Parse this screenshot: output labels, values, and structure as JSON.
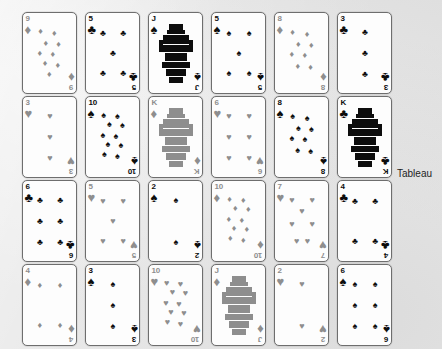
{
  "label": {
    "tableau": "Tableau"
  },
  "colors": {
    "background": "#e8e8e8",
    "card_face": "#fdfdfd",
    "card_border": "#6e6e6e",
    "black_suit": "#0d0d0d",
    "red_suit": "#8e8e8e",
    "label_text": "#1d1d1d"
  },
  "glyphs": {
    "spade": "♠",
    "heart": "♥",
    "diamond": "♦",
    "club": "♣"
  },
  "tableau": {
    "columns": 6,
    "rows": 4,
    "count": 24,
    "cards": [
      {
        "rank": "9",
        "suit": "diamond",
        "color": "red",
        "row": 1,
        "col": 1
      },
      {
        "rank": "5",
        "suit": "club",
        "color": "black",
        "row": 1,
        "col": 2
      },
      {
        "rank": "J",
        "suit": "spade",
        "color": "black",
        "row": 1,
        "col": 3
      },
      {
        "rank": "5",
        "suit": "spade",
        "color": "black",
        "row": 1,
        "col": 4
      },
      {
        "rank": "8",
        "suit": "diamond",
        "color": "red",
        "row": 1,
        "col": 5
      },
      {
        "rank": "3",
        "suit": "club",
        "color": "black",
        "row": 1,
        "col": 6
      },
      {
        "rank": "3",
        "suit": "heart",
        "color": "red",
        "row": 2,
        "col": 1
      },
      {
        "rank": "10",
        "suit": "spade",
        "color": "black",
        "row": 2,
        "col": 2
      },
      {
        "rank": "K",
        "suit": "diamond",
        "color": "red",
        "row": 2,
        "col": 3
      },
      {
        "rank": "6",
        "suit": "heart",
        "color": "red",
        "row": 2,
        "col": 4
      },
      {
        "rank": "8",
        "suit": "spade",
        "color": "black",
        "row": 2,
        "col": 5
      },
      {
        "rank": "K",
        "suit": "club",
        "color": "black",
        "row": 2,
        "col": 6
      },
      {
        "rank": "6",
        "suit": "club",
        "color": "black",
        "row": 3,
        "col": 1
      },
      {
        "rank": "5",
        "suit": "heart",
        "color": "red",
        "row": 3,
        "col": 2
      },
      {
        "rank": "2",
        "suit": "spade",
        "color": "black",
        "row": 3,
        "col": 3
      },
      {
        "rank": "10",
        "suit": "diamond",
        "color": "red",
        "row": 3,
        "col": 4
      },
      {
        "rank": "7",
        "suit": "heart",
        "color": "red",
        "row": 3,
        "col": 5
      },
      {
        "rank": "4",
        "suit": "club",
        "color": "black",
        "row": 3,
        "col": 6
      },
      {
        "rank": "4",
        "suit": "diamond",
        "color": "red",
        "row": 4,
        "col": 1
      },
      {
        "rank": "3",
        "suit": "spade",
        "color": "black",
        "row": 4,
        "col": 2
      },
      {
        "rank": "10",
        "suit": "heart",
        "color": "red",
        "row": 4,
        "col": 3
      },
      {
        "rank": "J",
        "suit": "diamond",
        "color": "red",
        "row": 4,
        "col": 4
      },
      {
        "rank": "2",
        "suit": "heart",
        "color": "red",
        "row": 4,
        "col": 5
      },
      {
        "rank": "6",
        "suit": "spade",
        "color": "black",
        "row": 4,
        "col": 6
      }
    ]
  }
}
